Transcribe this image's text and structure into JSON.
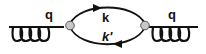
{
  "diagram": {
    "type": "feynman-diagram",
    "colors": {
      "line": "#111111",
      "vertex_fill": "#c8c8c8",
      "vertex_stroke": "#555555",
      "background": "#ffffff"
    },
    "labels": {
      "left_gluon": "q",
      "right_gluon": "q",
      "upper_propagator": "k",
      "lower_propagator": "k'"
    },
    "elements": [
      {
        "id": "left-gluon",
        "kind": "gluon",
        "label": "q"
      },
      {
        "id": "left-vertex",
        "kind": "vertex"
      },
      {
        "id": "upper-propagator",
        "kind": "fermion",
        "direction": "right",
        "label": "k"
      },
      {
        "id": "lower-propagator",
        "kind": "fermion",
        "direction": "left",
        "label": "k'"
      },
      {
        "id": "right-vertex",
        "kind": "vertex"
      },
      {
        "id": "right-gluon",
        "kind": "gluon",
        "label": "q"
      }
    ]
  }
}
